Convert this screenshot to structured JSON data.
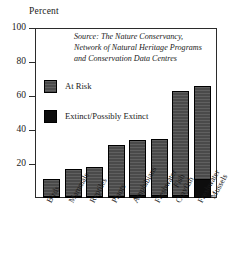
{
  "chart_data": {
    "type": "bar",
    "title": "",
    "ylabel": "Percent",
    "xlabel": "",
    "ylim": [
      0,
      100
    ],
    "yticks": [
      0,
      20,
      40,
      60,
      80,
      100
    ],
    "ytick_labels": [
      "",
      "20",
      "40",
      "60",
      "80",
      "100"
    ],
    "grid": false,
    "legend_position": "inside-upper-left",
    "categories": [
      "Birds",
      "Mammals",
      "Reptiles",
      "Plants",
      "Amphibians",
      "Freshwater\nFish",
      "Crayfish",
      "Freshwater\nMussels"
    ],
    "series": [
      {
        "name": "At Risk",
        "color": "#4a4a4a",
        "values": [
          11,
          17,
          18,
          31,
          34,
          35,
          63,
          66
        ]
      },
      {
        "name": "Extinct/Possibly Extinct",
        "color": "#0d0d0d",
        "values": [
          1,
          1,
          1,
          1,
          2,
          2,
          2,
          11
        ]
      }
    ],
    "annotations": [
      "Source: The Nature Conservancy,",
      "Network of Natural Heritage Programs",
      "and Conservation Data Centres"
    ]
  },
  "axis": {
    "y_title": "Percent",
    "ticks": [
      {
        "label": "100",
        "value": 100
      },
      {
        "label": "80",
        "value": 80
      },
      {
        "label": "60",
        "value": 60
      },
      {
        "label": "40",
        "value": 40
      },
      {
        "label": "20",
        "value": 20
      }
    ]
  },
  "source": {
    "line1": "Source: The Nature Conservancy,",
    "line2": "Network of Natural Heritage Programs",
    "line3": "and Conservation Data Centres"
  },
  "legend": {
    "items": [
      {
        "label": "At Risk",
        "swatch": "at-risk"
      },
      {
        "label": "Extinct/Possibly Extinct",
        "swatch": "extinct"
      }
    ]
  },
  "categories": [
    {
      "line1": "Birds",
      "line2": ""
    },
    {
      "line1": "Mammals",
      "line2": ""
    },
    {
      "line1": "Reptiles",
      "line2": ""
    },
    {
      "line1": "Plants",
      "line2": ""
    },
    {
      "line1": "Amphibians",
      "line2": ""
    },
    {
      "line1": "Freshwater",
      "line2": "Fish"
    },
    {
      "line1": "Crayfish",
      "line2": ""
    },
    {
      "line1": "Freshwater",
      "line2": "Mussels"
    }
  ],
  "colors": {
    "at_risk": "#4a4a4a",
    "extinct": "#0d0d0d",
    "frame": "#2b2b2b"
  }
}
